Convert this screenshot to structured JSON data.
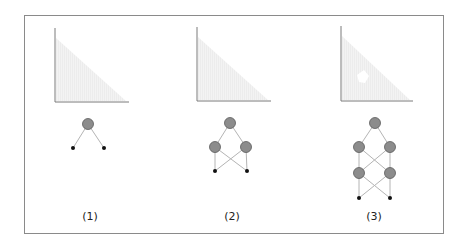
{
  "panels": [
    {
      "label": "(1)",
      "plot": {
        "axis_x": 55,
        "axis_top": 28,
        "axis_bottom": 102,
        "axis_right": 129,
        "hole": false
      },
      "network": {
        "nodes": [
          {
            "x": 88,
            "y": 124,
            "type": "hidden"
          },
          {
            "x": 73,
            "y": 148,
            "type": "input"
          },
          {
            "x": 104,
            "y": 148,
            "type": "input"
          }
        ],
        "edges": [
          [
            0,
            1
          ],
          [
            0,
            2
          ]
        ]
      },
      "label_x": 90
    },
    {
      "label": "(2)",
      "plot": {
        "axis_x": 197,
        "axis_top": 27,
        "axis_bottom": 101,
        "axis_right": 271,
        "hole": false
      },
      "network": {
        "nodes": [
          {
            "x": 230,
            "y": 123,
            "type": "hidden"
          },
          {
            "x": 215,
            "y": 147,
            "type": "hidden"
          },
          {
            "x": 246,
            "y": 147,
            "type": "hidden"
          },
          {
            "x": 215,
            "y": 171,
            "type": "input"
          },
          {
            "x": 247,
            "y": 171,
            "type": "input"
          }
        ],
        "edges": [
          [
            0,
            1
          ],
          [
            0,
            2
          ],
          [
            1,
            3
          ],
          [
            1,
            4
          ],
          [
            2,
            3
          ],
          [
            2,
            4
          ]
        ]
      },
      "label_x": 232
    },
    {
      "label": "(3)",
      "plot": {
        "axis_x": 341,
        "axis_top": 26,
        "axis_bottom": 101,
        "axis_right": 413,
        "hole": true,
        "hole_x": 362,
        "hole_y": 78
      },
      "network": {
        "nodes": [
          {
            "x": 375,
            "y": 123,
            "type": "hidden"
          },
          {
            "x": 359,
            "y": 147,
            "type": "hidden"
          },
          {
            "x": 390,
            "y": 147,
            "type": "hidden"
          },
          {
            "x": 359,
            "y": 173,
            "type": "hidden"
          },
          {
            "x": 390,
            "y": 173,
            "type": "hidden"
          },
          {
            "x": 359,
            "y": 198,
            "type": "input"
          },
          {
            "x": 390,
            "y": 198,
            "type": "input"
          }
        ],
        "edges": [
          [
            0,
            1
          ],
          [
            0,
            2
          ],
          [
            1,
            3
          ],
          [
            1,
            4
          ],
          [
            2,
            3
          ],
          [
            2,
            4
          ],
          [
            3,
            5
          ],
          [
            3,
            6
          ],
          [
            4,
            5
          ],
          [
            4,
            6
          ]
        ]
      },
      "label_x": 374
    }
  ],
  "colors": {
    "frame": "#8a8a8a",
    "axis": "#7a7a7a",
    "region_fill": "#ececec",
    "node_fill": "#8c8c8c",
    "node_stroke": "#5a5a5a",
    "edge": "#b4b4b4",
    "input_node": "#111111"
  },
  "label_y": 210
}
